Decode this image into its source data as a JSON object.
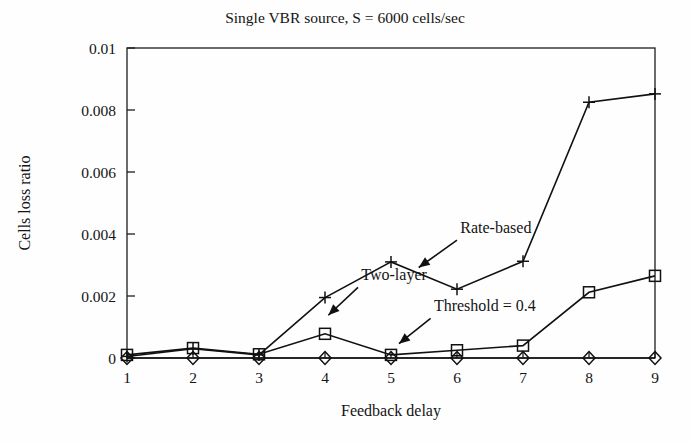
{
  "chart_data": {
    "type": "line",
    "title": "Single VBR source, S = 6000 cells/sec",
    "xlabel": "Feedback delay",
    "ylabel": "Cells loss ratio",
    "x": [
      1,
      2,
      3,
      4,
      5,
      6,
      7,
      8,
      9
    ],
    "xtick_labels": [
      "1",
      "2",
      "3",
      "4",
      "5",
      "6",
      "7",
      "8",
      "9"
    ],
    "ytick_labels": [
      "0",
      "0.002",
      "0.004",
      "0.006",
      "0.008",
      "0.01"
    ],
    "ytick_values": [
      0,
      0.002,
      0.004,
      0.006,
      0.008,
      0.01
    ],
    "xlim": [
      1,
      9
    ],
    "ylim": [
      0,
      0.01
    ],
    "grid": false,
    "legend_position": "inline-annotations",
    "series": [
      {
        "name": "Rate-based",
        "marker": "plus",
        "values": [
          5e-05,
          0.0003,
          0.0001,
          0.00195,
          0.0031,
          0.00222,
          0.00312,
          0.00825,
          0.00852
        ]
      },
      {
        "name": "Two-layer",
        "marker": "square",
        "values": [
          0.0001,
          0.00032,
          0.00012,
          0.00078,
          0.0001,
          0.00025,
          0.0004,
          0.00212,
          0.00265
        ]
      },
      {
        "name": "Threshold = 0.4",
        "marker": "diamond",
        "values": [
          0.0,
          0.0,
          0.0,
          0.0,
          0.0,
          0.0,
          0.0,
          0.0,
          0.0
        ]
      }
    ],
    "annotations": [
      {
        "text": "Rate-based",
        "x": 6.05,
        "y": 0.00402
      },
      {
        "text": "Two-layer",
        "x": 4.55,
        "y": 0.00252
      },
      {
        "text": "Threshold = 0.4",
        "x": 5.65,
        "y": 0.00152
      }
    ]
  },
  "colors": {
    "ink": "#111111",
    "axis": "#1d1d1d",
    "background": "#fefefe"
  }
}
